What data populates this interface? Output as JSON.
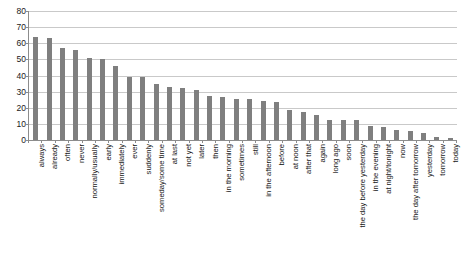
{
  "chart_data": {
    "type": "bar",
    "title": "",
    "subtitle": "",
    "xlabel": "",
    "ylabel": "",
    "ylim": [
      0,
      80
    ],
    "ytick_step": 10,
    "yticks": [
      0,
      10,
      20,
      30,
      40,
      50,
      60,
      70,
      80
    ],
    "grid": true,
    "legend": false,
    "legend_position": "none",
    "orientation": "vertical",
    "bar_color": "#7f7f7f",
    "gridline_color": "#c9c9c9",
    "axis_color": "#8c8c8c",
    "categories": [
      "always",
      "already",
      "often",
      "never",
      "normally/usually",
      "early",
      "immediately",
      "ever",
      "suddenly",
      "someday/some time",
      "at last",
      "not yet",
      "later",
      "then",
      "in the morning",
      "sometimes",
      "still",
      "in the afternoon",
      "before",
      "at noon",
      "after that",
      "again",
      "long ago",
      "soon",
      "the day before yesterday",
      "in the evening",
      "at night/tonight",
      "now",
      "the day after tomorrow",
      "yesterday",
      "tomorrow",
      "today"
    ],
    "values": [
      64,
      63,
      57,
      56,
      51,
      50,
      46,
      39,
      39,
      35,
      33,
      32,
      31,
      27,
      26.5,
      25.5,
      25.5,
      24,
      23.5,
      18.5,
      17.5,
      15.5,
      12.5,
      12.5,
      12.5,
      8.5,
      8,
      6.5,
      5.5,
      4.5,
      2,
      1
    ]
  }
}
